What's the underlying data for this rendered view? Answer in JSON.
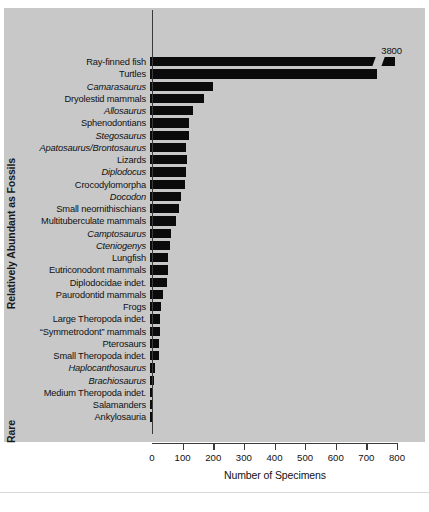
{
  "chart_data": {
    "type": "bar",
    "orientation": "horizontal",
    "title": "",
    "xlabel": "Number of Specimens",
    "ylabel_top": "Relatively Abundant as Fossils",
    "ylabel_bottom": "Rare",
    "xlim": [
      0,
      800
    ],
    "xticks": [
      0,
      100,
      200,
      300,
      400,
      500,
      600,
      700,
      800
    ],
    "xticklabels": [
      "0",
      "100",
      "200",
      "300",
      "400",
      "500",
      "600",
      "700",
      "800"
    ],
    "grid": false,
    "legend": null,
    "bar_color": "#0b0b0b",
    "panel_color": "#c8c8c8",
    "categories": [
      "Ray-finned fish",
      "Turtles",
      "Camarasaurus",
      "Dryolestid mammals",
      "Allosaurus",
      "Sphenodontians",
      "Stegosaurus",
      "Apatosaurus/Brontosaurus",
      "Lizards",
      "Diplodocus",
      "Crocodylomorpha",
      "Docodon",
      "Small neornithischians",
      "Multituberculate mammals",
      "Camptosaurus",
      "Cteniogenys",
      "Lungfish",
      "Eutriconodont mammals",
      "Diplodocidae indet.",
      "Paurodontid mammals",
      "Frogs",
      "Large Theropoda indet.",
      "“Symmetrodont” mammals",
      "Pterosaurs",
      "Small Theropoda indet.",
      "Haplocanthosaurus",
      "Brachiosaurus",
      "Medium Theropoda indet.",
      "Salamanders",
      "Ankylosauria"
    ],
    "italic_flags": [
      false,
      false,
      true,
      false,
      true,
      false,
      true,
      true,
      false,
      true,
      false,
      true,
      false,
      false,
      true,
      true,
      false,
      false,
      false,
      false,
      false,
      false,
      false,
      false,
      false,
      true,
      true,
      false,
      false,
      false
    ],
    "values": [
      3800,
      740,
      205,
      175,
      140,
      128,
      126,
      118,
      122,
      118,
      114,
      100,
      96,
      84,
      70,
      64,
      60,
      60,
      54,
      44,
      36,
      34,
      32,
      30,
      30,
      16,
      14,
      10,
      6,
      6
    ],
    "value_labels": [
      {
        "category": "Ray-finned fish",
        "text": "3800"
      }
    ],
    "axis_break": {
      "category": "Ray-finned fish",
      "note": "bar truncated with break symbol near 780"
    }
  }
}
